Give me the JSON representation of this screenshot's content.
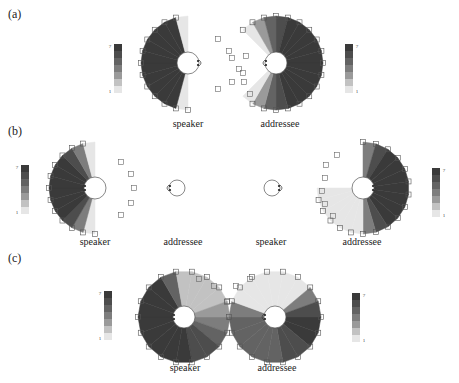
{
  "panels": [
    {
      "label": "(a)",
      "speaker_label": "speaker",
      "addressee_label": "addressee"
    },
    {
      "label": "(b)",
      "speaker_label": "speaker",
      "addressee_label": "addressee",
      "speaker2_label": "speaker",
      "addressee2_label": "addressee"
    },
    {
      "label": "(c)",
      "speaker_label": "speaker",
      "addressee_label": "addressee"
    }
  ],
  "legend": {
    "max": "7",
    "min": "1"
  },
  "colors": {
    "c7": "#3a3a3a",
    "c6": "#4d4d4d",
    "c5": "#636363",
    "c4": "#7d7d7d",
    "c3": "#9a9a9a",
    "c2": "#c2c2c2",
    "c1": "#e6e6e6"
  }
}
